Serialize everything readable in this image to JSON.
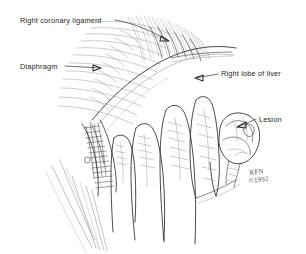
{
  "figure": {
    "medium": "pen-and-ink line drawing",
    "background_color": "#ffffff",
    "ink_color": "#3a3a3e",
    "width": 306,
    "height": 254
  },
  "labels": [
    {
      "id": "right-coronary-ligament",
      "text": "Right coronary ligament",
      "text_x": 20,
      "text_y": 23,
      "anchor": "start"
    },
    {
      "id": "diaphragm",
      "text": "Diaphragm",
      "text_x": 20,
      "text_y": 69,
      "anchor": "start"
    },
    {
      "id": "right-lobe-of-liver",
      "text": "Right lobe of liver",
      "text_x": 221,
      "text_y": 76,
      "anchor": "start"
    },
    {
      "id": "lesion",
      "text": "Lesion",
      "text_x": 259,
      "text_y": 122,
      "anchor": "start"
    }
  ],
  "signature": {
    "line1": "RFN",
    "line2": "©1992",
    "x": 250,
    "y": 174
  }
}
